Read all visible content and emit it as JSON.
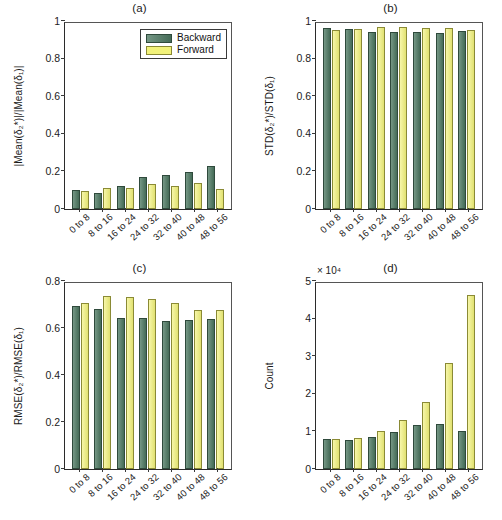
{
  "figure": {
    "panels": [
      "(a)",
      "(b)",
      "(c)",
      "(d)"
    ]
  },
  "legend": {
    "backward_label": "Backward",
    "forward_label": "Forward",
    "backward_color": "#4e7a63",
    "forward_color": "#f2f27a"
  },
  "axis": {
    "categories": [
      "0 to 8",
      "8 to 16",
      "16 to 24",
      "24 to 32",
      "32 to 40",
      "40 to 48",
      "48 to 56"
    ],
    "ticks_0_1": [
      "0",
      "0.2",
      "0.4",
      "0.6",
      "0.8",
      "1"
    ],
    "ticks_0_08": [
      "0",
      "0.2",
      "0.4",
      "0.6",
      "0.8"
    ],
    "ticks_0_5": [
      "0",
      "1",
      "2",
      "3",
      "4",
      "5"
    ],
    "exponent_label": "× 10⁴"
  },
  "ylabels": {
    "a": "|Mean(δ₂*)|/|Mean(δ₁)|",
    "b": "STD(δ₂*)/STD(δ₁)",
    "c": "RMSE(δ₂*)/RMSE(δ₁)",
    "d": "Count"
  },
  "chart_data": [
    {
      "type": "bar",
      "title": "(a)",
      "xlabel": "",
      "ylabel": "|Mean(δ₂*)|/|Mean(δ₁)|",
      "ylim": [
        0,
        1
      ],
      "yticks": [
        0,
        0.2,
        0.4,
        0.6,
        0.8,
        1
      ],
      "grid": false,
      "legend_position": "top-right",
      "categories": [
        "0 to 8",
        "8 to 16",
        "16 to 24",
        "24 to 32",
        "32 to 40",
        "40 to 48",
        "48 to 56"
      ],
      "series": [
        {
          "name": "Backward",
          "values": [
            0.1,
            0.085,
            0.125,
            0.17,
            0.18,
            0.195,
            0.23
          ]
        },
        {
          "name": "Forward",
          "values": [
            0.095,
            0.11,
            0.11,
            0.135,
            0.125,
            0.14,
            0.105
          ]
        }
      ]
    },
    {
      "type": "bar",
      "title": "(b)",
      "xlabel": "",
      "ylabel": "STD(δ₂*)/STD(δ₁)",
      "ylim": [
        0,
        1
      ],
      "yticks": [
        0,
        0.2,
        0.4,
        0.6,
        0.8,
        1
      ],
      "grid": false,
      "legend_position": "none",
      "categories": [
        "0 to 8",
        "8 to 16",
        "16 to 24",
        "24 to 32",
        "32 to 40",
        "40 to 48",
        "48 to 56"
      ],
      "series": [
        {
          "name": "Backward",
          "values": [
            0.962,
            0.958,
            0.941,
            0.94,
            0.944,
            0.938,
            0.948
          ]
        },
        {
          "name": "Forward",
          "values": [
            0.952,
            0.96,
            0.966,
            0.966,
            0.962,
            0.962,
            0.952
          ]
        }
      ]
    },
    {
      "type": "bar",
      "title": "(c)",
      "xlabel": "",
      "ylabel": "RMSE(δ₂*)/RMSE(δ₁)",
      "ylim": [
        0,
        0.8
      ],
      "yticks": [
        0,
        0.2,
        0.4,
        0.6,
        0.8
      ],
      "grid": false,
      "legend_position": "none",
      "categories": [
        "0 to 8",
        "8 to 16",
        "16 to 24",
        "24 to 32",
        "32 to 40",
        "40 to 48",
        "48 to 56"
      ],
      "series": [
        {
          "name": "Backward",
          "values": [
            0.693,
            0.68,
            0.643,
            0.643,
            0.63,
            0.635,
            0.637
          ]
        },
        {
          "name": "Forward",
          "values": [
            0.705,
            0.738,
            0.73,
            0.722,
            0.708,
            0.675,
            0.678
          ]
        }
      ]
    },
    {
      "type": "bar",
      "title": "(d)",
      "xlabel": "",
      "ylabel": "Count",
      "ylim": [
        0,
        50000
      ],
      "yticks": [
        0,
        10000,
        20000,
        30000,
        40000,
        50000
      ],
      "y_exponent": "× 10⁴",
      "grid": false,
      "legend_position": "none",
      "categories": [
        "0 to 8",
        "8 to 16",
        "16 to 24",
        "24 to 32",
        "32 to 40",
        "40 to 48",
        "48 to 56"
      ],
      "series": [
        {
          "name": "Backward",
          "values": [
            8000,
            7800,
            8600,
            9800,
            11800,
            11900,
            10000
          ]
        },
        {
          "name": "Forward",
          "values": [
            8000,
            8300,
            10000,
            13000,
            17800,
            28200,
            46200
          ]
        }
      ]
    }
  ]
}
